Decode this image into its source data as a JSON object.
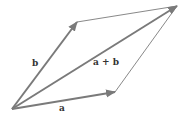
{
  "diagram": {
    "title": "",
    "type": "vector-addition-parallelogram",
    "colors": {
      "vector": "#7a7a7a",
      "edge": "#6a6a6a",
      "label": "#333333"
    },
    "labels": {
      "a": "a",
      "b": "b",
      "sum": "a + b"
    },
    "points": {
      "origin": [
        12,
        109
      ],
      "tip_a": [
        115,
        92
      ],
      "tip_b": [
        77,
        22
      ],
      "tip_sum": [
        177,
        6
      ]
    }
  }
}
